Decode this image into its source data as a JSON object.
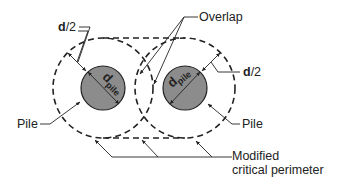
{
  "diagram": {
    "type": "pile punching-shear critical perimeter",
    "labels": {
      "d_half_left": "d",
      "d_half_left_suffix": "/2",
      "d_half_right": "d",
      "d_half_right_suffix": "/2",
      "overlap": "Overlap",
      "pile_left": "Pile",
      "pile_right": "Pile",
      "d_pile_left_main": "d",
      "d_pile_left_sub": "pile",
      "d_pile_right_main": "d",
      "d_pile_right_sub": "pile",
      "modified_line1": "Modified",
      "modified_line2": "critical perimeter"
    },
    "colors": {
      "pile_fill": "#8c8c8c",
      "line": "#222222",
      "background": "#ffffff"
    },
    "geometry": {
      "pile_left": {
        "cx": 103,
        "cy": 88,
        "r": 22
      },
      "pile_right": {
        "cx": 185,
        "cy": 88,
        "r": 22
      },
      "perimeter_radius": 50
    }
  }
}
